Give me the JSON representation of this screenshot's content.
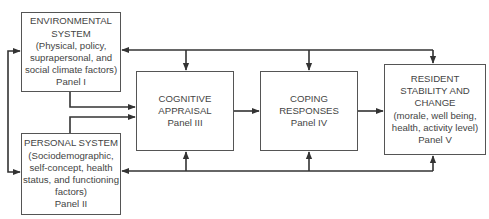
{
  "diagram": {
    "type": "flow-model",
    "boxes": [
      {
        "id": "panel-1",
        "lines": [
          "ENVIRONMENTAL",
          "SYSTEM",
          "(Physical, policy,",
          "suprapersonal, and",
          "social climate factors)",
          "Panel I"
        ]
      },
      {
        "id": "panel-2",
        "lines": [
          "PERSONAL SYSTEM",
          "(Sociodemographic,",
          "self-concept, health",
          "status, and functioning",
          "factors)",
          "Panel II"
        ]
      },
      {
        "id": "panel-3",
        "lines": [
          "COGNITIVE",
          "APPRAISAL",
          "Panel III"
        ]
      },
      {
        "id": "panel-4",
        "lines": [
          "COPING",
          "RESPONSES",
          "Panel IV"
        ]
      },
      {
        "id": "panel-5",
        "lines": [
          "RESIDENT",
          "STABILITY AND",
          "CHANGE",
          "(morale, well being,",
          "health, activity level)",
          "Panel V"
        ]
      }
    ],
    "edges": [
      {
        "from": "panel-1",
        "to": "panel-2",
        "note": "bidirectional bracket on left"
      },
      {
        "from": "panel-1",
        "to": "panel-3"
      },
      {
        "from": "panel-2",
        "to": "panel-3"
      },
      {
        "from": "panel-3",
        "to": "panel-4"
      },
      {
        "from": "panel-4",
        "to": "panel-5"
      },
      {
        "from": "top-bus",
        "to": [
          "panel-1",
          "panel-3",
          "panel-4",
          "panel-5"
        ]
      },
      {
        "from": "bottom-bus",
        "to": [
          "panel-2",
          "panel-3",
          "panel-4",
          "panel-5"
        ]
      }
    ],
    "line_color": "#333333"
  }
}
